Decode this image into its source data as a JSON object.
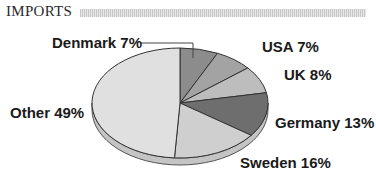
{
  "chart_data": {
    "type": "pie",
    "title": "IMPORTS",
    "style": "3d-tilted",
    "categories": [
      "Denmark",
      "USA",
      "UK",
      "Germany",
      "Sweden",
      "Other"
    ],
    "values": [
      7,
      7,
      8,
      13,
      16,
      49
    ],
    "unit": "%",
    "colors": [
      "#8c8c8c",
      "#a3a3a3",
      "#bdbdbd",
      "#6e6e6e",
      "#cfcfcf",
      "#e0e0e0"
    ],
    "labels": [
      "Denmark 7%",
      "USA 7%",
      "UK 8%",
      "Germany 13%",
      "Sweden 16%",
      "Other 49%"
    ],
    "legend": "none (direct labels)"
  },
  "header": {
    "title": "IMPORTS"
  }
}
